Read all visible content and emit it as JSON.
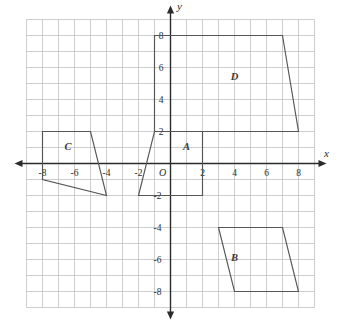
{
  "figure": {
    "grid": {
      "x_min": -9,
      "x_max": 9,
      "y_min": -9,
      "y_max": 9,
      "step": 1,
      "grid_color": "#b9b9b9",
      "axis_color": "#2b2b2b",
      "shape_color": "#555555"
    },
    "axes": {
      "x_label": "x",
      "y_label": "y",
      "origin_label": "O",
      "x_ticks": [
        {
          "value": -8,
          "label": "-8"
        },
        {
          "value": -6,
          "label": "-6"
        },
        {
          "value": -4,
          "label": "-4"
        },
        {
          "value": -2,
          "label": "-2"
        },
        {
          "value": 2,
          "label": "2"
        },
        {
          "value": 4,
          "label": "4"
        },
        {
          "value": 6,
          "label": "6"
        },
        {
          "value": 8,
          "label": "8"
        }
      ],
      "y_ticks": [
        {
          "value": 8,
          "label": "8"
        },
        {
          "value": 6,
          "label": "6"
        },
        {
          "value": 4,
          "label": "4"
        },
        {
          "value": 2,
          "label": "2"
        },
        {
          "value": -2,
          "label": "-2"
        },
        {
          "value": -4,
          "label": "-4"
        },
        {
          "value": -6,
          "label": "-6"
        },
        {
          "value": -8,
          "label": "-8"
        }
      ]
    },
    "shapes": [
      {
        "id": "A",
        "label": "A",
        "label_point": {
          "x": 1.0,
          "y": 0.85
        },
        "points": [
          {
            "x": -1.0,
            "y": 2.0
          },
          {
            "x": 2.0,
            "y": 2.0
          },
          {
            "x": 2.0,
            "y": -2.0
          },
          {
            "x": -2.0,
            "y": -2.0
          }
        ]
      },
      {
        "id": "B",
        "label": "B",
        "label_point": {
          "x": 4.0,
          "y": -6.1
        },
        "points": [
          {
            "x": 3.0,
            "y": -4.0
          },
          {
            "x": 7.0,
            "y": -4.0
          },
          {
            "x": 8.0,
            "y": -8.0
          },
          {
            "x": 4.0,
            "y": -8.0
          }
        ]
      },
      {
        "id": "C",
        "label": "C",
        "label_point": {
          "x": -6.4,
          "y": 0.85
        },
        "points": [
          {
            "x": -8.0,
            "y": 2.0
          },
          {
            "x": -5.0,
            "y": 2.0
          },
          {
            "x": -4.0,
            "y": -2.0
          },
          {
            "x": -8.0,
            "y": -1.0
          }
        ]
      },
      {
        "id": "D",
        "label": "D",
        "label_point": {
          "x": 4.0,
          "y": 5.2
        },
        "points": [
          {
            "x": -1.0,
            "y": 8.0
          },
          {
            "x": 7.0,
            "y": 8.0
          },
          {
            "x": 8.0,
            "y": 2.0
          },
          {
            "x": -1.0,
            "y": 2.0
          }
        ]
      }
    ]
  }
}
